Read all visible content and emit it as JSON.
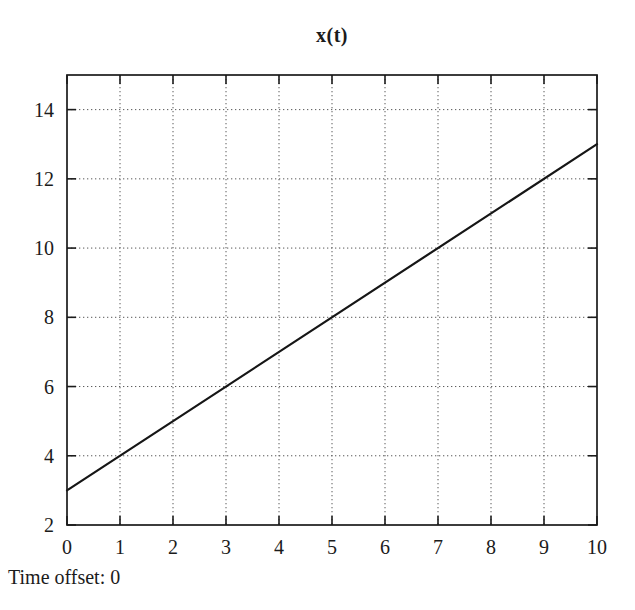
{
  "chart_data": {
    "type": "line",
    "title": "x(t)",
    "xlabel": "",
    "ylabel": "",
    "xlim": [
      0,
      10
    ],
    "ylim": [
      2,
      15
    ],
    "x_ticks": [
      0,
      1,
      2,
      3,
      4,
      5,
      6,
      7,
      8,
      9,
      10
    ],
    "y_ticks": [
      2,
      4,
      6,
      8,
      10,
      12,
      14
    ],
    "grid": "dotted",
    "legend": "none",
    "series": [
      {
        "name": "x(t)",
        "x": [
          0,
          10
        ],
        "y": [
          3,
          13
        ]
      }
    ]
  },
  "footer": {
    "label": "Time offset: 0"
  },
  "colors": {
    "background": "#ffffff",
    "axis": "#1b1b1b",
    "grid": "#585858",
    "line": "#161616",
    "text": "#1b1b1b"
  }
}
